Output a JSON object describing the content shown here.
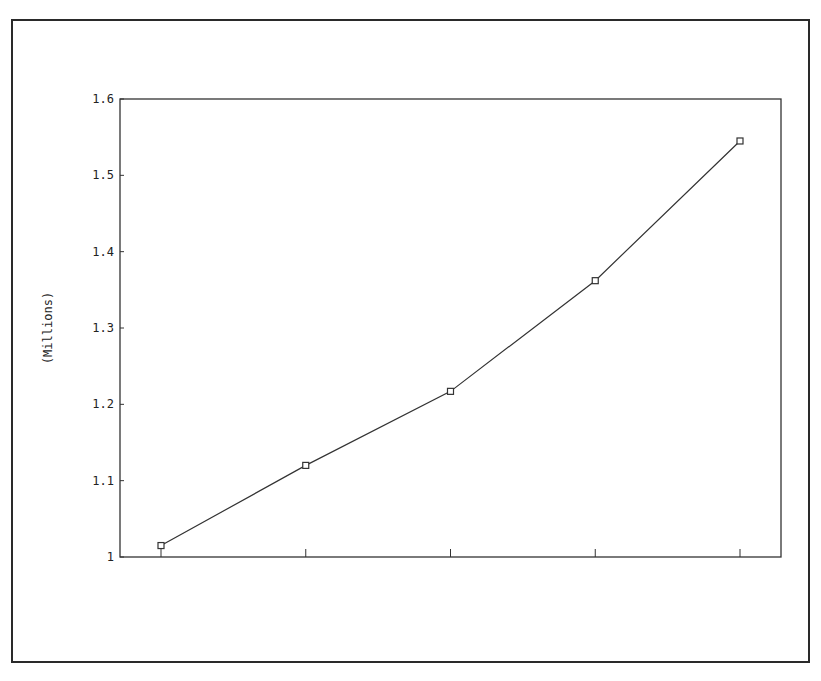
{
  "chart_data": {
    "type": "line",
    "title": "",
    "xlabel": "",
    "ylabel": "(Millions)",
    "x": [
      1,
      2,
      3,
      4,
      5
    ],
    "x_tick_labels": [
      "",
      "",
      "",
      "",
      ""
    ],
    "series": [
      {
        "name": "series-1",
        "values": [
          1.015,
          1.12,
          1.217,
          1.362,
          1.545
        ],
        "marker": "square",
        "color": "#333333"
      }
    ],
    "ylim": [
      1.0,
      1.6
    ],
    "y_ticks": [
      1.0,
      1.1,
      1.2,
      1.3,
      1.4,
      1.5,
      1.6
    ],
    "y_tick_labels": [
      "1",
      "1.1",
      "1.2",
      "1.3",
      "1.4",
      "1.5",
      "1.6"
    ],
    "grid": false,
    "legend": "none"
  }
}
